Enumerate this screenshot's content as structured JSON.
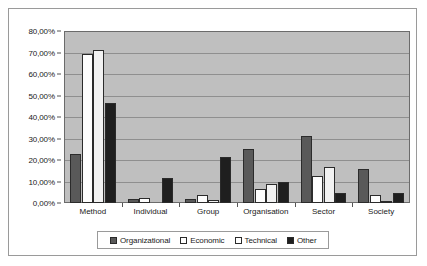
{
  "chart_data": {
    "type": "bar",
    "title": "",
    "xlabel": "",
    "ylabel": "",
    "ylim": [
      0,
      0.8
    ],
    "grid": true,
    "legend_position": "bottom",
    "categories": [
      "Method",
      "Individual",
      "Group",
      "Organisation",
      "Sector",
      "Society"
    ],
    "y_tick_labels": [
      "0,00%",
      "10,00%",
      "20,00%",
      "30,00%",
      "40,00%",
      "50,00%",
      "60,00%",
      "70,00%",
      "80,00%"
    ],
    "y_tick_values": [
      0,
      10,
      20,
      30,
      40,
      50,
      60,
      70,
      80
    ],
    "series": [
      {
        "name": "Organizational",
        "color": "#595959",
        "values": [
          23.0,
          2.0,
          1.7,
          25.0,
          31.0,
          16.0
        ]
      },
      {
        "name": "Economic",
        "color": "#ffffff",
        "values": [
          69.5,
          2.5,
          3.5,
          6.5,
          12.5,
          3.5
        ]
      },
      {
        "name": "Technical",
        "color": "#f2f2f2",
        "values": [
          71.0,
          0.0,
          1.3,
          9.0,
          16.8,
          0.3
        ]
      },
      {
        "name": "Other",
        "color": "#1f1f1f",
        "values": [
          46.7,
          11.5,
          21.4,
          9.8,
          4.8,
          4.7
        ]
      }
    ]
  }
}
